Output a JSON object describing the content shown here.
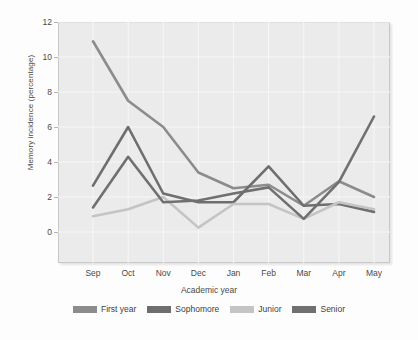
{
  "chart_data": {
    "type": "line",
    "title": "",
    "xlabel": "Academic year",
    "ylabel": "Memory incidence (percentage)",
    "categories": [
      "Sep",
      "Oct",
      "Nov",
      "Dec",
      "Jan",
      "Feb",
      "Mar",
      "Apr",
      "May"
    ],
    "ylim": [
      0,
      12
    ],
    "yticks": [
      0,
      2,
      4,
      6,
      8,
      10,
      12
    ],
    "grid": true,
    "legend_position": "bottom",
    "series": [
      {
        "name": "First year",
        "color": "#8c8c8c",
        "values": [
          10.9,
          7.5,
          6.0,
          3.4,
          2.5,
          2.7,
          1.5,
          2.9,
          2.0
        ]
      },
      {
        "name": "Sophomore",
        "color": "#6e6e6e",
        "values": [
          2.65,
          6.0,
          2.2,
          1.7,
          1.7,
          3.75,
          1.5,
          1.6,
          1.15
        ]
      },
      {
        "name": "Junior",
        "color": "#c4c4c4",
        "values": [
          0.9,
          1.3,
          2.0,
          0.25,
          1.6,
          1.6,
          0.75,
          1.7,
          1.3
        ]
      },
      {
        "name": "Senior",
        "color": "#707070",
        "values": [
          1.4,
          4.3,
          1.7,
          1.8,
          2.2,
          2.55,
          0.75,
          2.85,
          6.6
        ]
      }
    ]
  },
  "legend": {
    "items": [
      {
        "label": "First year",
        "color": "#8c8c8c"
      },
      {
        "label": "Sophomore",
        "color": "#6e6e6e"
      },
      {
        "label": "Junior",
        "color": "#c4c4c4"
      },
      {
        "label": "Senior",
        "color": "#707070"
      }
    ]
  },
  "colors": {
    "plot_background": "#ebebeb",
    "gridline": "#f7f7f7",
    "frame_border": "#c8c8c8",
    "text": "#4a4a4a",
    "page_background": "#fdfdfd"
  }
}
